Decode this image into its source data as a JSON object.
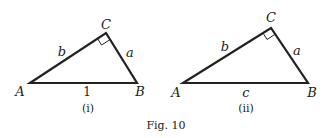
{
  "figure": {
    "caption": "Fig. 10",
    "triangles": [
      {
        "id": "i",
        "sublabel": "(i)",
        "vertices": {
          "A": "A",
          "B": "B",
          "C": "C"
        },
        "sides": {
          "AC": "b",
          "CB": "a",
          "AB": "1"
        },
        "right_angle_at": "C"
      },
      {
        "id": "ii",
        "sublabel": "(ii)",
        "vertices": {
          "A": "A",
          "B": "B",
          "C": "C"
        },
        "sides": {
          "AC": "b",
          "CB": "a",
          "AB": "c"
        },
        "right_angle_at": "C"
      }
    ]
  }
}
